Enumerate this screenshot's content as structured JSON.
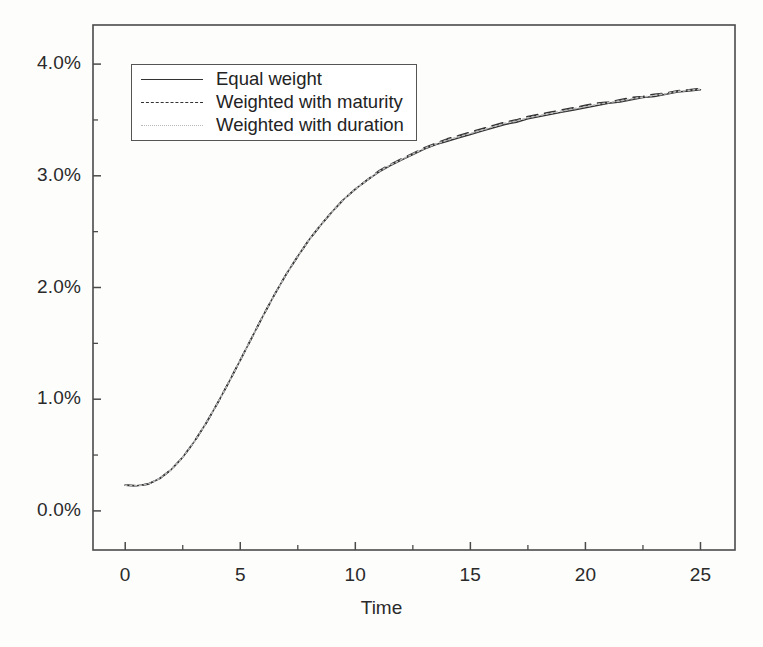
{
  "figure": {
    "background_color": "#fdfdfc",
    "frame_color": "#4a4a4a"
  },
  "axes": {
    "x_title": "Time",
    "y_title": "",
    "x_ticks": [
      "0",
      "5",
      "10",
      "15",
      "20",
      "25"
    ],
    "y_ticks": [
      "0.0%",
      "1.0%",
      "2.0%",
      "3.0%",
      "4.0%"
    ]
  },
  "legend": {
    "items": [
      {
        "label": "Equal weight",
        "style": "solid",
        "color": "#333333"
      },
      {
        "label": "Weighted with maturity",
        "style": "dashed",
        "color": "#333333"
      },
      {
        "label": "Weighted with duration",
        "style": "dotted",
        "color": "#b9b9b9"
      }
    ]
  },
  "chart_data": {
    "type": "line",
    "title": "",
    "xlabel": "Time",
    "ylabel": "",
    "xlim": [
      -1.4,
      26.5
    ],
    "ylim": [
      -0.35,
      4.35
    ],
    "xticks": [
      0,
      5,
      10,
      15,
      20,
      25
    ],
    "yticks": [
      0.0,
      1.0,
      2.0,
      3.0,
      4.0
    ],
    "yticklabels": [
      "0.0%",
      "1.0%",
      "2.0%",
      "3.0%",
      "4.0%"
    ],
    "minor_yticks": [
      0.5,
      1.5,
      2.5,
      3.5
    ],
    "minor_xticks": [
      2.5,
      7.5,
      12.5,
      17.5,
      22.5
    ],
    "grid": false,
    "legend_position": "upper left",
    "units": "percent",
    "x": [
      0,
      0.5,
      1,
      1.5,
      2,
      2.5,
      3,
      3.5,
      4,
      4.5,
      5,
      5.5,
      6,
      6.5,
      7,
      7.5,
      8,
      8.5,
      9,
      9.5,
      10,
      10.5,
      11,
      11.5,
      12,
      12.5,
      13,
      13.5,
      14,
      14.5,
      15,
      15.5,
      16,
      16.5,
      17,
      17.5,
      18,
      18.5,
      19,
      19.5,
      20,
      20.5,
      21,
      21.5,
      22,
      22.5,
      23,
      23.5,
      24,
      24.5,
      25
    ],
    "series": [
      {
        "name": "Equal weight",
        "style": "solid",
        "color": "#333333",
        "values": [
          0.23,
          0.225,
          0.24,
          0.29,
          0.37,
          0.48,
          0.62,
          0.78,
          0.96,
          1.15,
          1.35,
          1.55,
          1.75,
          1.94,
          2.12,
          2.28,
          2.43,
          2.56,
          2.68,
          2.79,
          2.88,
          2.96,
          3.03,
          3.09,
          3.14,
          3.19,
          3.24,
          3.28,
          3.31,
          3.34,
          3.37,
          3.4,
          3.43,
          3.46,
          3.48,
          3.51,
          3.53,
          3.55,
          3.57,
          3.59,
          3.61,
          3.63,
          3.65,
          3.66,
          3.68,
          3.7,
          3.71,
          3.73,
          3.75,
          3.76,
          3.77
        ]
      },
      {
        "name": "Weighted with maturity",
        "style": "dashed",
        "color": "#333333",
        "values": [
          0.23,
          0.225,
          0.24,
          0.29,
          0.37,
          0.48,
          0.62,
          0.78,
          0.96,
          1.15,
          1.35,
          1.55,
          1.75,
          1.94,
          2.12,
          2.28,
          2.43,
          2.56,
          2.68,
          2.79,
          2.88,
          2.96,
          3.04,
          3.1,
          3.15,
          3.2,
          3.25,
          3.29,
          3.33,
          3.36,
          3.39,
          3.42,
          3.45,
          3.48,
          3.5,
          3.53,
          3.55,
          3.57,
          3.59,
          3.61,
          3.63,
          3.65,
          3.66,
          3.68,
          3.7,
          3.71,
          3.73,
          3.74,
          3.76,
          3.77,
          3.78
        ]
      },
      {
        "name": "Weighted with duration",
        "style": "dotted",
        "color": "#b9b9b9",
        "values": [
          0.23,
          0.225,
          0.24,
          0.29,
          0.37,
          0.48,
          0.62,
          0.78,
          0.96,
          1.15,
          1.35,
          1.55,
          1.75,
          1.94,
          2.12,
          2.28,
          2.43,
          2.56,
          2.68,
          2.79,
          2.88,
          2.96,
          3.035,
          3.095,
          3.145,
          3.195,
          3.245,
          3.285,
          3.32,
          3.35,
          3.38,
          3.41,
          3.44,
          3.47,
          3.49,
          3.52,
          3.54,
          3.56,
          3.58,
          3.6,
          3.62,
          3.64,
          3.655,
          3.67,
          3.69,
          3.705,
          3.72,
          3.735,
          3.755,
          3.765,
          3.775
        ]
      }
    ]
  }
}
